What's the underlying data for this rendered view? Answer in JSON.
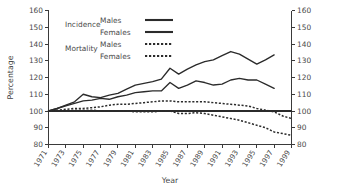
{
  "chart_data": {
    "type": "line",
    "title": "",
    "xlabel": "Year",
    "ylabel": "Percentage",
    "xlim": [
      1971,
      1999
    ],
    "ylim": [
      80,
      160
    ],
    "ytick_values": [
      80,
      90,
      100,
      110,
      120,
      130,
      140,
      150,
      160
    ],
    "ytick_labels": [
      "80",
      "90",
      "100",
      "110",
      "120",
      "130",
      "140",
      "150",
      "160"
    ],
    "xtick_values": [
      1971,
      1973,
      1975,
      1977,
      1979,
      1981,
      1983,
      1985,
      1987,
      1989,
      1991,
      1993,
      1995,
      1997,
      1999
    ],
    "xtick_labels": [
      "1971",
      "1973",
      "1975",
      "1977",
      "1979",
      "1981",
      "1983",
      "1985",
      "1987",
      "1989",
      "1991",
      "1993",
      "1995",
      "1997",
      "1999"
    ],
    "grid": false,
    "right_axis_mirrored": true,
    "right_ytick_labels": [
      "80",
      "90",
      "100",
      "110",
      "120",
      "130",
      "140",
      "150",
      "160"
    ],
    "reference_line_y": 100,
    "legend_position": "top-left-inside",
    "series": [
      {
        "name": "Incidence Males",
        "group": "Incidence",
        "sex": "Males",
        "style": "solid",
        "x": [
          1971,
          1972,
          1973,
          1974,
          1975,
          1976,
          1977,
          1978,
          1979,
          1980,
          1981,
          1982,
          1983,
          1984,
          1985,
          1986,
          1987,
          1988,
          1989,
          1990,
          1991,
          1992,
          1993,
          1994,
          1995,
          1996,
          1997
        ],
        "values": [
          100,
          101.5,
          103.5,
          105.5,
          110,
          108.5,
          108,
          109.5,
          110.5,
          113,
          115.5,
          116.5,
          117.5,
          119,
          125.5,
          122,
          125,
          127.5,
          129.5,
          130.5,
          133,
          135.5,
          134,
          131,
          128,
          130.5,
          133.5
        ]
      },
      {
        "name": "Incidence Females",
        "group": "Incidence",
        "sex": "Females",
        "style": "solid",
        "x": [
          1971,
          1972,
          1973,
          1974,
          1975,
          1976,
          1977,
          1978,
          1979,
          1980,
          1981,
          1982,
          1983,
          1984,
          1985,
          1986,
          1987,
          1988,
          1989,
          1990,
          1991,
          1992,
          1993,
          1994,
          1995,
          1996,
          1997
        ],
        "values": [
          100,
          101.5,
          103,
          104.5,
          106,
          106.5,
          107.5,
          107,
          108.5,
          109.5,
          111,
          111.5,
          112,
          112,
          117,
          113.5,
          115.5,
          118,
          117,
          115.5,
          116,
          118.5,
          119.5,
          118.5,
          118.5,
          116,
          113.5
        ]
      },
      {
        "name": "Mortality Males",
        "group": "Mortality",
        "sex": "Males",
        "style": "dotted",
        "x": [
          1971,
          1972,
          1973,
          1974,
          1975,
          1976,
          1977,
          1978,
          1979,
          1980,
          1981,
          1982,
          1983,
          1984,
          1985,
          1986,
          1987,
          1988,
          1989,
          1990,
          1991,
          1992,
          1993,
          1994,
          1995,
          1996,
          1997,
          1998,
          1999
        ],
        "values": [
          100,
          100.5,
          101,
          101.5,
          101.5,
          102,
          102.5,
          103.5,
          104,
          104,
          104.5,
          105,
          105.5,
          106,
          106,
          105.5,
          105.5,
          105.5,
          105.5,
          105,
          104.5,
          104,
          103.5,
          103,
          101.5,
          100.5,
          99.5,
          97,
          95.5
        ]
      },
      {
        "name": "Mortality Females",
        "group": "Mortality",
        "sex": "Females",
        "style": "dotted",
        "x": [
          1971,
          1972,
          1973,
          1974,
          1975,
          1976,
          1977,
          1978,
          1979,
          1980,
          1981,
          1982,
          1983,
          1984,
          1985,
          1986,
          1987,
          1988,
          1989,
          1990,
          1991,
          1992,
          1993,
          1994,
          1995,
          1996,
          1997,
          1998,
          1999
        ],
        "values": [
          100,
          100,
          100,
          100.5,
          100.5,
          100.5,
          100,
          100,
          100,
          100,
          99.5,
          99.5,
          99.5,
          100,
          100,
          98.5,
          98.5,
          99,
          98.5,
          97.5,
          96.5,
          95.5,
          94.5,
          93,
          91.5,
          90,
          87.5,
          86.5,
          85.5
        ]
      }
    ],
    "legend": [
      {
        "group": "Incidence",
        "items": [
          {
            "label": "Males",
            "style": "solid"
          },
          {
            "label": "Females",
            "style": "solid"
          }
        ]
      },
      {
        "group": "Mortality",
        "items": [
          {
            "label": "Males",
            "style": "dotted"
          },
          {
            "label": "Females",
            "style": "dotted"
          }
        ]
      }
    ],
    "colors": {
      "line": "#2b2b2b",
      "axis": "#3a3a3a",
      "text": "#4a4a4a"
    }
  }
}
